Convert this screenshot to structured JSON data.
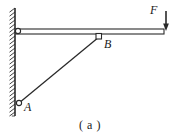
{
  "figure": {
    "caption": "( a )",
    "background_color": "#ffffff",
    "line_color": "#2a2a2a",
    "fill_color": "#ffffff",
    "width": 180,
    "height": 139
  },
  "labels": {
    "force": "F",
    "joint_b": "B",
    "joint_a": "A"
  },
  "geometry": {
    "wall": {
      "x": 15,
      "y_top": 8,
      "y_bottom": 116,
      "hatch_direction": "up-right",
      "hatch_count": 26
    },
    "beam": {
      "x_left": 16,
      "x_right": 164,
      "y_top": 29,
      "y_bottom": 34
    },
    "brace": {
      "x1": 19,
      "y1": 103,
      "x2": 99,
      "y2": 37
    },
    "pin_top": {
      "cx": 18,
      "cy": 31,
      "r": 2.6
    },
    "pin_a": {
      "cx": 19,
      "cy": 103,
      "r": 2.6
    },
    "joint_b_square": {
      "x": 96,
      "y": 33,
      "size": 5.5
    },
    "force_arrow": {
      "x": 166,
      "y_start": 11,
      "y_end": 30
    }
  }
}
